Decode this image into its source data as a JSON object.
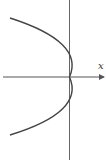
{
  "diagram": {
    "title": "",
    "axes": {
      "x_label": "x",
      "x_axis_arrow": true,
      "y_axis_arrow": false
    },
    "curve": {
      "type": "parabola",
      "orientation": "opens-left",
      "vertex": "origin"
    },
    "colors": {
      "axis": "#555555",
      "curve": "#444444",
      "background": "#ffffff"
    }
  }
}
